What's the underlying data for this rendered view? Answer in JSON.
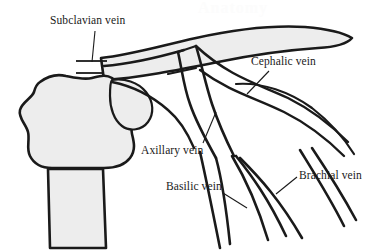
{
  "figure": {
    "type": "anatomical-diagram",
    "background_color": "#ffffff",
    "outline_color": "#1a1a1a",
    "bone_fill_color": "#ededed",
    "label_text_color": "#1a1a1a",
    "watermark_text": "Anatomy"
  },
  "labels": {
    "subclavian": "Subclavian vein",
    "cephalic": "Cephalic vein",
    "axillary": "Axillary vein",
    "basilic": "Basilic vein",
    "brachial": "Brachial vein"
  },
  "structures": {
    "clavicle": "clavicle-bone",
    "scapula": "scapula-bone",
    "humerus": "humerus-bone",
    "subclavian_vein": "subclavian-vein-vessel",
    "cephalic_vein": "cephalic-vein-vessel",
    "axillary_vein": "axillary-vein-vessel",
    "basilic_vein": "basilic-vein-vessel",
    "brachial_vein": "brachial-vein-vessel"
  }
}
